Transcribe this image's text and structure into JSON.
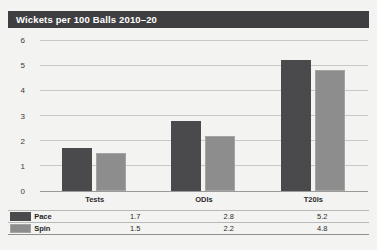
{
  "chart_data": {
    "type": "bar",
    "title": "Wickets per 100 Balls 2010–20",
    "xlabel": "",
    "ylabel": "",
    "ylim": [
      0,
      6
    ],
    "yticks": [
      0,
      1,
      2,
      3,
      4,
      5,
      6
    ],
    "grid": true,
    "legend_position": "bottom-table",
    "categories": [
      "Tests",
      "ODIs",
      "T20Is"
    ],
    "series": [
      {
        "name": "Pace",
        "color": "#4a4a4c",
        "values": [
          1.7,
          2.8,
          5.2
        ]
      },
      {
        "name": "Spin",
        "color": "#8d8d8d",
        "values": [
          1.5,
          2.2,
          4.8
        ]
      }
    ]
  },
  "yticklabels": [
    "6",
    "5",
    "4",
    "3",
    "2",
    "1",
    "0"
  ],
  "legend_rows": [
    {
      "name": "Pace",
      "swatch": "pace-color-swatch",
      "cells": [
        "1.7",
        "2.8",
        "5.2"
      ]
    },
    {
      "name": "Spin",
      "swatch": "spin-color-swatch",
      "cells": [
        "1.5",
        "2.2",
        "4.8"
      ]
    }
  ]
}
